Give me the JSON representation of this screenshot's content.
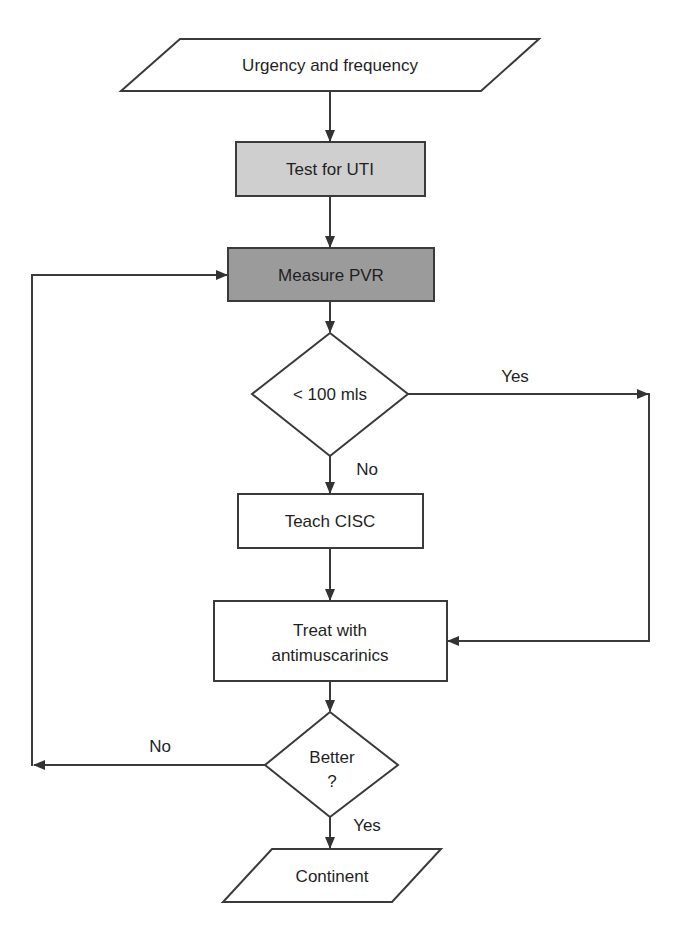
{
  "diagram": {
    "type": "flowchart",
    "colors": {
      "stroke": "#3a3a3a",
      "text": "#1f1f1f",
      "background": "#ffffff",
      "light_gray_fill": "#cfcfcf",
      "dark_gray_fill": "#9b9b9b",
      "white_fill": "#ffffff"
    },
    "nodes": {
      "start": {
        "shape": "parallelogram",
        "label": "Urgency and frequency"
      },
      "test_uti": {
        "shape": "rectangle",
        "fill": "light_gray",
        "label": "Test for UTI"
      },
      "measure_pvr": {
        "shape": "rectangle",
        "fill": "dark_gray",
        "label": "Measure PVR"
      },
      "pvr_check": {
        "shape": "diamond",
        "label": "< 100 mls"
      },
      "teach_cisc": {
        "shape": "rectangle",
        "fill": "white",
        "label": "Teach CISC"
      },
      "treat": {
        "shape": "rectangle",
        "fill": "white",
        "label_line1": "Treat with",
        "label_line2": "antimuscarinics"
      },
      "better_check": {
        "shape": "diamond",
        "label_line1": "Better",
        "label_line2": "?"
      },
      "end": {
        "shape": "parallelogram",
        "label": "Continent"
      }
    },
    "edges": [
      {
        "from": "start",
        "to": "test_uti",
        "label": ""
      },
      {
        "from": "test_uti",
        "to": "measure_pvr",
        "label": ""
      },
      {
        "from": "measure_pvr",
        "to": "pvr_check",
        "label": ""
      },
      {
        "from": "pvr_check",
        "to": "treat",
        "label": "Yes"
      },
      {
        "from": "pvr_check",
        "to": "teach_cisc",
        "label": "No"
      },
      {
        "from": "teach_cisc",
        "to": "treat",
        "label": ""
      },
      {
        "from": "treat",
        "to": "better_check",
        "label": ""
      },
      {
        "from": "better_check",
        "to": "measure_pvr",
        "label": "No"
      },
      {
        "from": "better_check",
        "to": "end",
        "label": "Yes"
      }
    ],
    "edge_labels": {
      "pvr_yes": "Yes",
      "pvr_no": "No",
      "better_no": "No",
      "better_yes": "Yes"
    }
  }
}
